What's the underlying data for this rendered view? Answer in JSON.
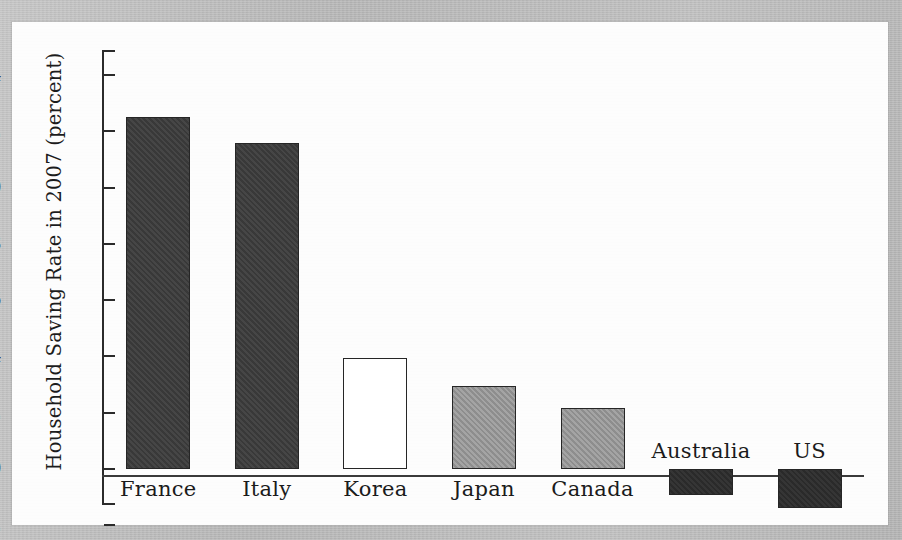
{
  "figure": {
    "background_color": "#b9b9b9",
    "panel_color": "#fdfdfd"
  },
  "chart_data": {
    "type": "bar",
    "title": "",
    "xlabel": "",
    "ylabel": "Household Saving Rate in 2007 (percent)",
    "categories": [
      "France",
      "Italy",
      "Korea",
      "Japan",
      "Canada",
      "Australia",
      "US"
    ],
    "values": [
      12.5,
      11.6,
      3.95,
      2.95,
      2.15,
      -0.95,
      -1.4
    ],
    "ylim": [
      -2,
      14
    ],
    "ytick_labels": [
      "14",
      "12",
      "10",
      "8",
      "6",
      "4",
      "2",
      "0",
      "-2"
    ],
    "ytick_values": [
      14,
      12,
      10,
      8,
      6,
      4,
      2,
      0,
      -2
    ],
    "grid": false,
    "legend": false,
    "bar_styles": [
      "dark",
      "dark",
      "white",
      "mid",
      "mid",
      "black",
      "black"
    ],
    "bar_colors": {
      "dark": "#3c3c3c",
      "mid": "#959595",
      "white": "#ffffff",
      "black": "#2d2d2d",
      "edge": "#262626"
    },
    "label_positions": [
      "below",
      "below",
      "below",
      "below",
      "below",
      "above",
      "above"
    ]
  }
}
